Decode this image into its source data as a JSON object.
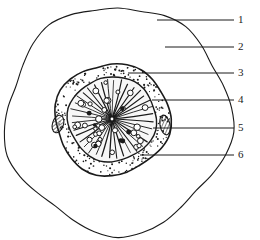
{
  "figure": {
    "type": "botanical-cross-section-line-drawing",
    "title": "",
    "background_color": "#ffffff",
    "ink_color": "#1a1a1a",
    "width": 260,
    "height": 240
  },
  "labels": [
    {
      "id": "1",
      "text": "1",
      "x": 238,
      "y": 14,
      "leader_from_x": 157,
      "leader_from_y": 20,
      "leader_to_x": 234,
      "leader_to_y": 20,
      "target": "outer-boundary-line"
    },
    {
      "id": "2",
      "text": "2",
      "x": 238,
      "y": 41,
      "leader_from_x": 165,
      "leader_from_y": 47,
      "leader_to_x": 234,
      "leader_to_y": 47,
      "target": "outer-cortex-field"
    },
    {
      "id": "3",
      "text": "3",
      "x": 238,
      "y": 67,
      "leader_from_x": 128,
      "leader_from_y": 73,
      "leader_to_x": 234,
      "leader_to_y": 73,
      "target": "core-outer-rim"
    },
    {
      "id": "4",
      "text": "4",
      "x": 238,
      "y": 94,
      "leader_from_x": 152,
      "leader_from_y": 100,
      "leader_to_x": 234,
      "leader_to_y": 100,
      "target": "stippled-ring-layer"
    },
    {
      "id": "5",
      "text": "5",
      "x": 238,
      "y": 122,
      "leader_from_x": 153,
      "leader_from_y": 128,
      "leader_to_x": 234,
      "leader_to_y": 128,
      "target": "hatched-patch-right"
    },
    {
      "id": "6",
      "text": "6",
      "x": 238,
      "y": 149,
      "leader_from_x": 140,
      "leader_from_y": 155,
      "leader_to_x": 234,
      "leader_to_y": 155,
      "target": "radial-ray-zone"
    }
  ],
  "structures": {
    "outer_boundary": {
      "name": "outer-boundary",
      "fill": "#ffffff",
      "stroke": "#1a1a1a",
      "stroke_width": 1.1
    },
    "core_outline": {
      "name": "core-outline",
      "fill": "#ffffff",
      "stroke": "#1a1a1a",
      "stroke_width": 1.6
    },
    "stipple_ring": {
      "name": "stipple-ring",
      "dot_color": "#1a1a1a",
      "dot_count": 300
    },
    "inner_stele": {
      "name": "inner-stele",
      "fill": "#f7f7f7",
      "stroke": "#1a1a1a",
      "stroke_width": 1.4
    },
    "rays": {
      "name": "radial-rays",
      "count": 36,
      "stroke": "#1a1a1a"
    },
    "vessels": {
      "name": "vessel-circles",
      "count": 34,
      "fill": "#ffffff",
      "stroke": "#1a1a1a"
    },
    "hatched_patches": {
      "name": "hatched-patches",
      "count": 2,
      "stroke": "#1a1a1a"
    }
  },
  "center": {
    "x": 112,
    "y": 119
  }
}
